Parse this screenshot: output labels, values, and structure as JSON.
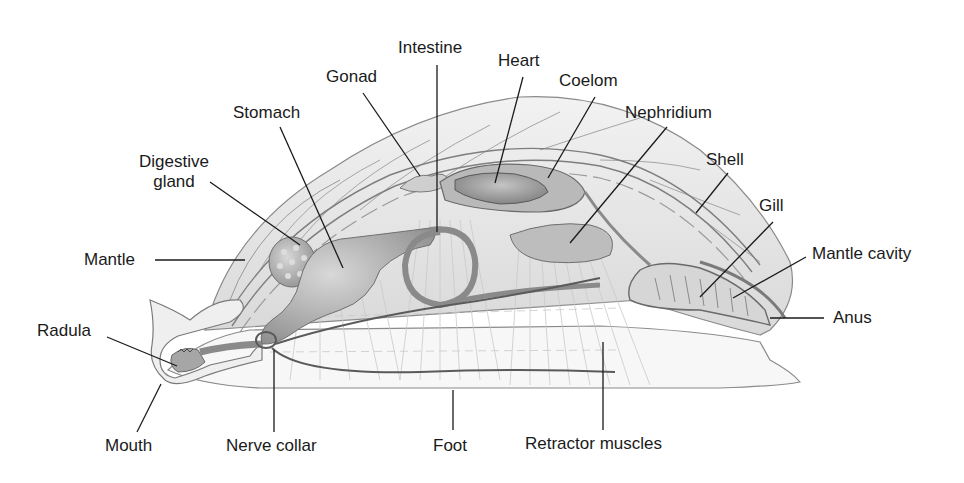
{
  "diagram": {
    "labels": {
      "intestine": "Intestine",
      "gonad": "Gonad",
      "heart": "Heart",
      "coelom": "Coelom",
      "stomach": "Stomach",
      "nephridium": "Nephridium",
      "digestive_gland_line1": "Digestive",
      "digestive_gland_line2": "gland",
      "shell": "Shell",
      "gill": "Gill",
      "mantle": "Mantle",
      "mantle_cavity": "Mantle cavity",
      "anus": "Anus",
      "radula": "Radula",
      "mouth": "Mouth",
      "nerve_collar": "Nerve collar",
      "foot": "Foot",
      "retractor_muscles": "Retractor muscles"
    },
    "colors": {
      "background": "#ffffff",
      "label_text": "#1a1a1a",
      "leader_line": "#1a1a1a",
      "outline": "#6e6e6e",
      "organ_shade": "#a8a8a8",
      "light_shade": "#e6e6e6"
    }
  }
}
